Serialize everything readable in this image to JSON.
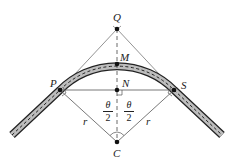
{
  "diagram": {
    "type": "geometry",
    "points": {
      "Q": {
        "label": "Q",
        "x": 117,
        "y": 29
      },
      "M": {
        "label": "M",
        "x": 117,
        "y": 64
      },
      "N": {
        "label": "N",
        "x": 117,
        "y": 90
      },
      "P": {
        "label": "P",
        "x": 60,
        "y": 90
      },
      "S": {
        "label": "S",
        "x": 174,
        "y": 90
      },
      "C": {
        "label": "C",
        "x": 117,
        "y": 142
      }
    },
    "radius_labels": {
      "left": "r",
      "right": "r"
    },
    "angle_labels": {
      "left": {
        "numerator": "θ",
        "denominator": "2"
      },
      "right": {
        "numerator": "θ",
        "denominator": "2"
      }
    },
    "colors": {
      "line": "#555555",
      "road_fill": "#bdbdbd",
      "road_edge": "#222222",
      "point": "#111111"
    }
  }
}
